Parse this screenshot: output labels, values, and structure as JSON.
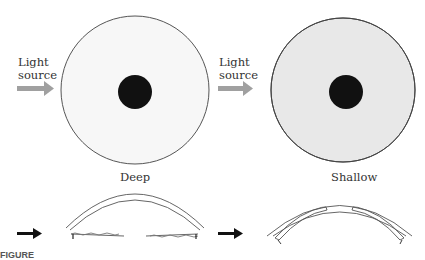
{
  "panels": [
    {
      "id": "deep",
      "light_label_line1": "Light",
      "light_label_line2": "source",
      "caption": "Deep",
      "iris_shading": "uniform"
    },
    {
      "id": "shallow",
      "light_label_line1": "Light",
      "light_label_line2": "source",
      "caption": "Shallow",
      "iris_shading": "shadowed-nasal-side"
    }
  ],
  "figure_caption_truncated": "FIGURE",
  "colors": {
    "arrow_gray": "#a0a0a0",
    "arrow_black": "#111111",
    "pupil": "#111111",
    "outline": "#555555"
  }
}
